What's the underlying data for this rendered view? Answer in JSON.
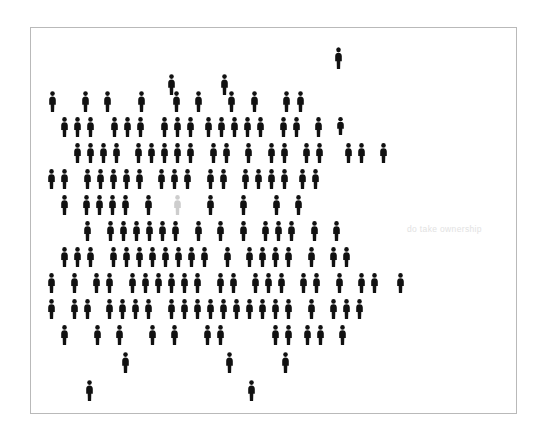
{
  "poster": {
    "caption": "do take ownership",
    "caption_color": "#e2e2e2",
    "background_color": "#ffffff",
    "frame_border_color": "#b9b9b9",
    "figure_color": "#111111",
    "highlight_figure_color": "#cdcdcd",
    "figure_icon": "person-pictogram",
    "total_figures": 167,
    "highlighted_figures": 1
  },
  "crowd": {
    "figure_width": 9,
    "figure_height": 20,
    "figures": [
      {
        "x": 303,
        "y": 19,
        "h": 22,
        "c": "dark"
      },
      {
        "x": 136,
        "y": 46,
        "h": 21,
        "c": "dark"
      },
      {
        "x": 189,
        "y": 46,
        "h": 21,
        "c": "dark"
      },
      {
        "x": 17,
        "y": 63,
        "h": 21,
        "c": "dark"
      },
      {
        "x": 50,
        "y": 63,
        "h": 21,
        "c": "dark"
      },
      {
        "x": 72,
        "y": 63,
        "h": 21,
        "c": "dark"
      },
      {
        "x": 106,
        "y": 63,
        "h": 21,
        "c": "dark"
      },
      {
        "x": 141,
        "y": 63,
        "h": 21,
        "c": "dark"
      },
      {
        "x": 163,
        "y": 63,
        "h": 21,
        "c": "dark"
      },
      {
        "x": 196,
        "y": 63,
        "h": 21,
        "c": "dark"
      },
      {
        "x": 219,
        "y": 63,
        "h": 21,
        "c": "dark"
      },
      {
        "x": 251,
        "y": 63,
        "h": 21,
        "c": "dark"
      },
      {
        "x": 265,
        "y": 63,
        "h": 21,
        "c": "dark"
      },
      {
        "x": 29,
        "y": 89,
        "h": 20,
        "c": "dark"
      },
      {
        "x": 42,
        "y": 89,
        "h": 20,
        "c": "dark"
      },
      {
        "x": 55,
        "y": 89,
        "h": 20,
        "c": "dark"
      },
      {
        "x": 79,
        "y": 89,
        "h": 20,
        "c": "dark"
      },
      {
        "x": 92,
        "y": 89,
        "h": 20,
        "c": "dark"
      },
      {
        "x": 105,
        "y": 89,
        "h": 20,
        "c": "dark"
      },
      {
        "x": 129,
        "y": 89,
        "h": 20,
        "c": "dark"
      },
      {
        "x": 142,
        "y": 89,
        "h": 20,
        "c": "dark"
      },
      {
        "x": 155,
        "y": 89,
        "h": 20,
        "c": "dark"
      },
      {
        "x": 173,
        "y": 89,
        "h": 20,
        "c": "dark"
      },
      {
        "x": 186,
        "y": 89,
        "h": 20,
        "c": "dark"
      },
      {
        "x": 199,
        "y": 89,
        "h": 20,
        "c": "dark"
      },
      {
        "x": 212,
        "y": 89,
        "h": 20,
        "c": "dark"
      },
      {
        "x": 225,
        "y": 89,
        "h": 20,
        "c": "dark"
      },
      {
        "x": 248,
        "y": 89,
        "h": 20,
        "c": "dark"
      },
      {
        "x": 261,
        "y": 89,
        "h": 20,
        "c": "dark"
      },
      {
        "x": 283,
        "y": 89,
        "h": 20,
        "c": "dark"
      },
      {
        "x": 305,
        "y": 89,
        "h": 18,
        "c": "dark"
      },
      {
        "x": 42,
        "y": 115,
        "h": 20,
        "c": "dark"
      },
      {
        "x": 55,
        "y": 115,
        "h": 20,
        "c": "dark"
      },
      {
        "x": 68,
        "y": 115,
        "h": 20,
        "c": "dark"
      },
      {
        "x": 81,
        "y": 115,
        "h": 20,
        "c": "dark"
      },
      {
        "x": 103,
        "y": 115,
        "h": 20,
        "c": "dark"
      },
      {
        "x": 116,
        "y": 115,
        "h": 20,
        "c": "dark"
      },
      {
        "x": 129,
        "y": 115,
        "h": 20,
        "c": "dark"
      },
      {
        "x": 142,
        "y": 115,
        "h": 20,
        "c": "dark"
      },
      {
        "x": 155,
        "y": 115,
        "h": 20,
        "c": "dark"
      },
      {
        "x": 178,
        "y": 115,
        "h": 20,
        "c": "dark"
      },
      {
        "x": 191,
        "y": 115,
        "h": 20,
        "c": "dark"
      },
      {
        "x": 213,
        "y": 115,
        "h": 20,
        "c": "dark"
      },
      {
        "x": 236,
        "y": 115,
        "h": 20,
        "c": "dark"
      },
      {
        "x": 249,
        "y": 115,
        "h": 20,
        "c": "dark"
      },
      {
        "x": 271,
        "y": 115,
        "h": 20,
        "c": "dark"
      },
      {
        "x": 284,
        "y": 115,
        "h": 20,
        "c": "dark"
      },
      {
        "x": 313,
        "y": 115,
        "h": 20,
        "c": "dark"
      },
      {
        "x": 326,
        "y": 115,
        "h": 20,
        "c": "dark"
      },
      {
        "x": 348,
        "y": 115,
        "h": 20,
        "c": "dark"
      },
      {
        "x": 16,
        "y": 141,
        "h": 20,
        "c": "dark"
      },
      {
        "x": 29,
        "y": 141,
        "h": 20,
        "c": "dark"
      },
      {
        "x": 52,
        "y": 141,
        "h": 20,
        "c": "dark"
      },
      {
        "x": 65,
        "y": 141,
        "h": 20,
        "c": "dark"
      },
      {
        "x": 78,
        "y": 141,
        "h": 20,
        "c": "dark"
      },
      {
        "x": 91,
        "y": 141,
        "h": 20,
        "c": "dark"
      },
      {
        "x": 104,
        "y": 141,
        "h": 20,
        "c": "dark"
      },
      {
        "x": 126,
        "y": 141,
        "h": 20,
        "c": "dark"
      },
      {
        "x": 139,
        "y": 141,
        "h": 20,
        "c": "dark"
      },
      {
        "x": 152,
        "y": 141,
        "h": 20,
        "c": "dark"
      },
      {
        "x": 175,
        "y": 141,
        "h": 20,
        "c": "dark"
      },
      {
        "x": 188,
        "y": 141,
        "h": 20,
        "c": "dark"
      },
      {
        "x": 210,
        "y": 141,
        "h": 20,
        "c": "dark"
      },
      {
        "x": 223,
        "y": 141,
        "h": 20,
        "c": "dark"
      },
      {
        "x": 236,
        "y": 141,
        "h": 20,
        "c": "dark"
      },
      {
        "x": 249,
        "y": 141,
        "h": 20,
        "c": "dark"
      },
      {
        "x": 267,
        "y": 141,
        "h": 20,
        "c": "dark"
      },
      {
        "x": 280,
        "y": 141,
        "h": 20,
        "c": "dark"
      },
      {
        "x": 29,
        "y": 167,
        "h": 20,
        "c": "dark"
      },
      {
        "x": 51,
        "y": 167,
        "h": 20,
        "c": "dark"
      },
      {
        "x": 64,
        "y": 167,
        "h": 20,
        "c": "dark"
      },
      {
        "x": 77,
        "y": 167,
        "h": 20,
        "c": "dark"
      },
      {
        "x": 90,
        "y": 167,
        "h": 20,
        "c": "dark"
      },
      {
        "x": 113,
        "y": 167,
        "h": 20,
        "c": "dark"
      },
      {
        "x": 142,
        "y": 167,
        "h": 20,
        "c": "highlight"
      },
      {
        "x": 175,
        "y": 167,
        "h": 20,
        "c": "dark"
      },
      {
        "x": 208,
        "y": 167,
        "h": 20,
        "c": "dark"
      },
      {
        "x": 241,
        "y": 167,
        "h": 20,
        "c": "dark"
      },
      {
        "x": 263,
        "y": 167,
        "h": 20,
        "c": "dark"
      },
      {
        "x": 52,
        "y": 193,
        "h": 20,
        "c": "dark"
      },
      {
        "x": 75,
        "y": 193,
        "h": 20,
        "c": "dark"
      },
      {
        "x": 88,
        "y": 193,
        "h": 20,
        "c": "dark"
      },
      {
        "x": 101,
        "y": 193,
        "h": 20,
        "c": "dark"
      },
      {
        "x": 114,
        "y": 193,
        "h": 20,
        "c": "dark"
      },
      {
        "x": 127,
        "y": 193,
        "h": 20,
        "c": "dark"
      },
      {
        "x": 140,
        "y": 193,
        "h": 20,
        "c": "dark"
      },
      {
        "x": 163,
        "y": 193,
        "h": 20,
        "c": "dark"
      },
      {
        "x": 185,
        "y": 193,
        "h": 20,
        "c": "dark"
      },
      {
        "x": 208,
        "y": 193,
        "h": 20,
        "c": "dark"
      },
      {
        "x": 230,
        "y": 193,
        "h": 20,
        "c": "dark"
      },
      {
        "x": 243,
        "y": 193,
        "h": 20,
        "c": "dark"
      },
      {
        "x": 256,
        "y": 193,
        "h": 20,
        "c": "dark"
      },
      {
        "x": 279,
        "y": 193,
        "h": 20,
        "c": "dark"
      },
      {
        "x": 301,
        "y": 193,
        "h": 20,
        "c": "dark"
      },
      {
        "x": 29,
        "y": 219,
        "h": 20,
        "c": "dark"
      },
      {
        "x": 42,
        "y": 219,
        "h": 20,
        "c": "dark"
      },
      {
        "x": 55,
        "y": 219,
        "h": 20,
        "c": "dark"
      },
      {
        "x": 78,
        "y": 219,
        "h": 20,
        "c": "dark"
      },
      {
        "x": 91,
        "y": 219,
        "h": 20,
        "c": "dark"
      },
      {
        "x": 104,
        "y": 219,
        "h": 20,
        "c": "dark"
      },
      {
        "x": 117,
        "y": 219,
        "h": 20,
        "c": "dark"
      },
      {
        "x": 130,
        "y": 219,
        "h": 20,
        "c": "dark"
      },
      {
        "x": 143,
        "y": 219,
        "h": 20,
        "c": "dark"
      },
      {
        "x": 156,
        "y": 219,
        "h": 20,
        "c": "dark"
      },
      {
        "x": 169,
        "y": 219,
        "h": 20,
        "c": "dark"
      },
      {
        "x": 192,
        "y": 219,
        "h": 20,
        "c": "dark"
      },
      {
        "x": 214,
        "y": 219,
        "h": 20,
        "c": "dark"
      },
      {
        "x": 227,
        "y": 219,
        "h": 20,
        "c": "dark"
      },
      {
        "x": 240,
        "y": 219,
        "h": 20,
        "c": "dark"
      },
      {
        "x": 253,
        "y": 219,
        "h": 20,
        "c": "dark"
      },
      {
        "x": 276,
        "y": 219,
        "h": 20,
        "c": "dark"
      },
      {
        "x": 298,
        "y": 219,
        "h": 20,
        "c": "dark"
      },
      {
        "x": 311,
        "y": 219,
        "h": 20,
        "c": "dark"
      },
      {
        "x": 16,
        "y": 245,
        "h": 20,
        "c": "dark"
      },
      {
        "x": 39,
        "y": 245,
        "h": 20,
        "c": "dark"
      },
      {
        "x": 61,
        "y": 245,
        "h": 20,
        "c": "dark"
      },
      {
        "x": 74,
        "y": 245,
        "h": 20,
        "c": "dark"
      },
      {
        "x": 97,
        "y": 245,
        "h": 20,
        "c": "dark"
      },
      {
        "x": 110,
        "y": 245,
        "h": 20,
        "c": "dark"
      },
      {
        "x": 123,
        "y": 245,
        "h": 20,
        "c": "dark"
      },
      {
        "x": 136,
        "y": 245,
        "h": 20,
        "c": "dark"
      },
      {
        "x": 149,
        "y": 245,
        "h": 20,
        "c": "dark"
      },
      {
        "x": 162,
        "y": 245,
        "h": 20,
        "c": "dark"
      },
      {
        "x": 185,
        "y": 245,
        "h": 20,
        "c": "dark"
      },
      {
        "x": 198,
        "y": 245,
        "h": 20,
        "c": "dark"
      },
      {
        "x": 220,
        "y": 245,
        "h": 20,
        "c": "dark"
      },
      {
        "x": 233,
        "y": 245,
        "h": 20,
        "c": "dark"
      },
      {
        "x": 246,
        "y": 245,
        "h": 20,
        "c": "dark"
      },
      {
        "x": 268,
        "y": 245,
        "h": 20,
        "c": "dark"
      },
      {
        "x": 281,
        "y": 245,
        "h": 20,
        "c": "dark"
      },
      {
        "x": 304,
        "y": 245,
        "h": 20,
        "c": "dark"
      },
      {
        "x": 326,
        "y": 245,
        "h": 20,
        "c": "dark"
      },
      {
        "x": 339,
        "y": 245,
        "h": 20,
        "c": "dark"
      },
      {
        "x": 365,
        "y": 245,
        "h": 20,
        "c": "dark"
      },
      {
        "x": 16,
        "y": 271,
        "h": 20,
        "c": "dark"
      },
      {
        "x": 39,
        "y": 271,
        "h": 20,
        "c": "dark"
      },
      {
        "x": 52,
        "y": 271,
        "h": 20,
        "c": "dark"
      },
      {
        "x": 74,
        "y": 271,
        "h": 20,
        "c": "dark"
      },
      {
        "x": 87,
        "y": 271,
        "h": 20,
        "c": "dark"
      },
      {
        "x": 100,
        "y": 271,
        "h": 20,
        "c": "dark"
      },
      {
        "x": 113,
        "y": 271,
        "h": 20,
        "c": "dark"
      },
      {
        "x": 136,
        "y": 271,
        "h": 20,
        "c": "dark"
      },
      {
        "x": 149,
        "y": 271,
        "h": 20,
        "c": "dark"
      },
      {
        "x": 162,
        "y": 271,
        "h": 20,
        "c": "dark"
      },
      {
        "x": 175,
        "y": 271,
        "h": 20,
        "c": "dark"
      },
      {
        "x": 188,
        "y": 271,
        "h": 20,
        "c": "dark"
      },
      {
        "x": 201,
        "y": 271,
        "h": 20,
        "c": "dark"
      },
      {
        "x": 214,
        "y": 271,
        "h": 20,
        "c": "dark"
      },
      {
        "x": 227,
        "y": 271,
        "h": 20,
        "c": "dark"
      },
      {
        "x": 240,
        "y": 271,
        "h": 20,
        "c": "dark"
      },
      {
        "x": 253,
        "y": 271,
        "h": 20,
        "c": "dark"
      },
      {
        "x": 276,
        "y": 271,
        "h": 20,
        "c": "dark"
      },
      {
        "x": 298,
        "y": 271,
        "h": 20,
        "c": "dark"
      },
      {
        "x": 311,
        "y": 271,
        "h": 20,
        "c": "dark"
      },
      {
        "x": 324,
        "y": 271,
        "h": 20,
        "c": "dark"
      },
      {
        "x": 29,
        "y": 297,
        "h": 20,
        "c": "dark"
      },
      {
        "x": 62,
        "y": 297,
        "h": 20,
        "c": "dark"
      },
      {
        "x": 84,
        "y": 297,
        "h": 20,
        "c": "dark"
      },
      {
        "x": 117,
        "y": 297,
        "h": 20,
        "c": "dark"
      },
      {
        "x": 139,
        "y": 297,
        "h": 20,
        "c": "dark"
      },
      {
        "x": 172,
        "y": 297,
        "h": 20,
        "c": "dark"
      },
      {
        "x": 185,
        "y": 297,
        "h": 20,
        "c": "dark"
      },
      {
        "x": 240,
        "y": 297,
        "h": 20,
        "c": "dark"
      },
      {
        "x": 253,
        "y": 297,
        "h": 20,
        "c": "dark"
      },
      {
        "x": 272,
        "y": 297,
        "h": 20,
        "c": "dark"
      },
      {
        "x": 285,
        "y": 297,
        "h": 20,
        "c": "dark"
      },
      {
        "x": 307,
        "y": 297,
        "h": 20,
        "c": "dark"
      },
      {
        "x": 90,
        "y": 324,
        "h": 21,
        "c": "dark"
      },
      {
        "x": 194,
        "y": 324,
        "h": 21,
        "c": "dark"
      },
      {
        "x": 250,
        "y": 324,
        "h": 21,
        "c": "dark"
      },
      {
        "x": 54,
        "y": 352,
        "h": 21,
        "c": "dark"
      },
      {
        "x": 216,
        "y": 352,
        "h": 21,
        "c": "dark"
      }
    ]
  }
}
